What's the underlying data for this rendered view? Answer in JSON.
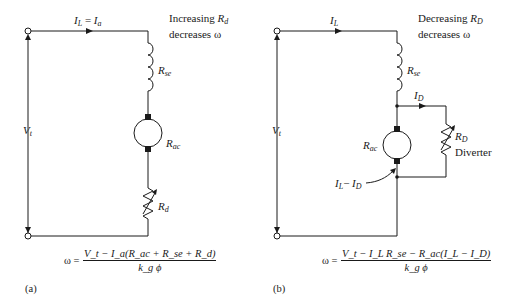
{
  "figure_a": {
    "caption": "(a)",
    "current_label": {
      "main": "I",
      "sub1": "L",
      "eq": " = ",
      "main2": "I",
      "sub2": "a"
    },
    "note_line1": {
      "text": "Increasing ",
      "var": "R",
      "sub": "d"
    },
    "note_line2": "decreases ω",
    "series_field": {
      "main": "R",
      "sub": "se"
    },
    "armature": {
      "main": "R",
      "sub": "ac"
    },
    "resistor": {
      "main": "R",
      "sub": "d"
    },
    "voltage": {
      "main": "V",
      "sub": "t"
    },
    "equation": {
      "lhs": "ω =",
      "numerator": "V_t − I_a(R_ac + R_se + R_d)",
      "denominator": "k_g ϕ"
    }
  },
  "figure_b": {
    "caption": "(b)",
    "current_label": {
      "main": "I",
      "sub": "L"
    },
    "note_line1": {
      "text": "Decreasing ",
      "var": "R",
      "sub": "D"
    },
    "note_line2": "decreases ω",
    "series_field": {
      "main": "R",
      "sub": "se"
    },
    "diverter_current": {
      "main": "I",
      "sub": "D"
    },
    "armature": {
      "main": "R",
      "sub": "ac"
    },
    "diverter": {
      "main": "R",
      "sub": "D",
      "name": "Diverter"
    },
    "armature_current": {
      "main1": "I",
      "sub1": "L",
      "minus": "− ",
      "main2": "I",
      "sub2": "D"
    },
    "voltage": {
      "main": "V",
      "sub": "t"
    },
    "equation": {
      "lhs": "ω =",
      "numerator": "V_t − I_L R_se − R_ac(I_L − I_D)",
      "denominator": "k_g ϕ"
    }
  },
  "colors": {
    "ink": "#1a1a1a",
    "background": "#ffffff"
  }
}
